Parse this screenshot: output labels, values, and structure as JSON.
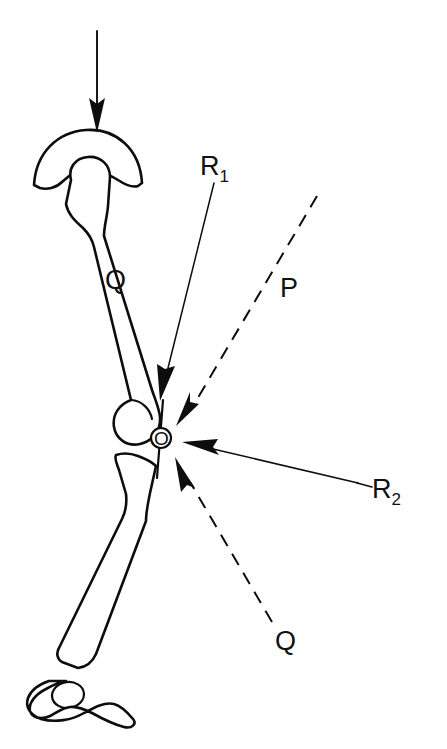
{
  "figure": {
    "background_color": "#ffffff",
    "ink_color": "#0d0d0d",
    "width": 447,
    "height": 749
  },
  "labels": {
    "load_arrow": "",
    "femur_force": "Q",
    "reaction_one": "R",
    "reaction_one_sub": "1",
    "reaction_two": "R",
    "reaction_two_sub": "2",
    "patellar_force": "P",
    "lower_force": "Q",
    "joint_point": "O"
  },
  "anatomy": [
    {
      "name": "acetabulum-socket",
      "description": "Pelvic acetabulum dome cap above femoral head"
    },
    {
      "name": "femoral-head-neck",
      "description": "Rounded femoral head and neck entering socket"
    },
    {
      "name": "femur-shaft",
      "description": "Long femur shaft angled down and to the right"
    },
    {
      "name": "femoral-condyle",
      "description": "Distal femur condyle at knee"
    },
    {
      "name": "tibia-plateau",
      "description": "Proximal tibia plateau below knee"
    },
    {
      "name": "tibia-shaft",
      "description": "Tibia shaft descending to ankle"
    },
    {
      "name": "ankle-talus",
      "description": "Small rounded talus bone at ankle"
    },
    {
      "name": "foot-outline",
      "description": "Foot profile resting on ground"
    }
  ],
  "vectors": [
    {
      "name": "body-load",
      "label": "",
      "style": "solid",
      "arrow": "end",
      "from": [
        97,
        31
      ],
      "to": [
        97,
        130
      ],
      "description": "Downward body-weight load applied at the hip"
    },
    {
      "name": "reaction-R1",
      "label": "R1",
      "style": "solid",
      "arrow": "end",
      "from": [
        214,
        183
      ],
      "to": [
        160,
        398
      ],
      "description": "Joint reaction force R1 directed down-left into the knee"
    },
    {
      "name": "patellar-tendon-P",
      "label": "P",
      "style": "dashed",
      "arrow": "end",
      "from": [
        317,
        196
      ],
      "to": [
        177,
        424
      ],
      "description": "Patellar / quadriceps tendon force P directed down-left to point O"
    },
    {
      "name": "reaction-R2",
      "label": "R2",
      "style": "solid",
      "arrow": "end",
      "from": [
        358,
        483
      ],
      "to": [
        183,
        443
      ],
      "description": "Joint reaction force R2 directed left toward point O"
    },
    {
      "name": "lower-force-Q",
      "label": "Q",
      "style": "dashed",
      "arrow": "end",
      "from": [
        272,
        622
      ],
      "to": [
        176,
        458
      ],
      "description": "Force Q from the lower leg directed up-left to point O"
    }
  ],
  "text_items": [
    {
      "name": "label-R1",
      "text": "R",
      "sub": "1",
      "x": 200,
      "y": 175
    },
    {
      "name": "label-Q-femur",
      "text": "Q",
      "sub": "",
      "x": 105,
      "y": 289
    },
    {
      "name": "label-P",
      "text": "P",
      "sub": "",
      "x": 280,
      "y": 297
    },
    {
      "name": "label-R2",
      "text": "R",
      "sub": "2",
      "x": 372,
      "y": 498
    },
    {
      "name": "label-Q-lower",
      "text": "Q",
      "sub": "",
      "x": 275,
      "y": 650
    },
    {
      "name": "label-O",
      "text": "O",
      "sub": "",
      "x": 159,
      "y": 441
    }
  ]
}
